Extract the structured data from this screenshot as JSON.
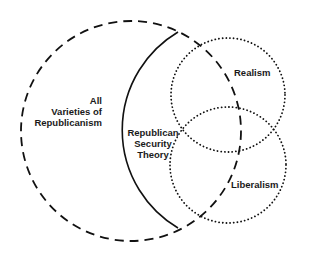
{
  "diagram": {
    "type": "venn",
    "sets": [
      {
        "id": "all-republicanism",
        "label_lines": [
          "All",
          "Varieties of",
          "Republicanism"
        ],
        "stroke_style": "dashed",
        "color": "#111111"
      },
      {
        "id": "republican-security-theory",
        "label_lines": [
          "Republican",
          "Security",
          "Theory"
        ],
        "stroke_style": "solid",
        "color": "#111111"
      },
      {
        "id": "realism",
        "label_lines": [
          "Realism"
        ],
        "stroke_style": "dotted",
        "color": "#111111"
      },
      {
        "id": "liberalism",
        "label_lines": [
          "Liberalism"
        ],
        "stroke_style": "dotted",
        "color": "#111111"
      }
    ]
  }
}
